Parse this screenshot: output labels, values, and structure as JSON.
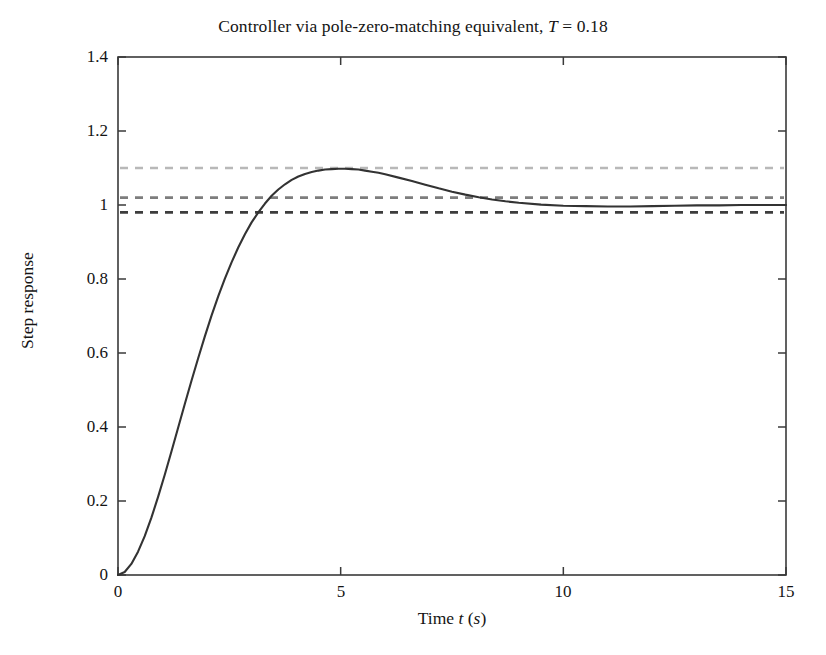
{
  "chart_data": {
    "type": "line",
    "title": "Controller via pole-zero-matching equivalent, T = 0.18",
    "title_parts": {
      "text_before": "Controller via pole-zero-matching equivalent, ",
      "symbol": "T",
      "text_after": " = 0.18"
    },
    "xlabel": "Time t (s)",
    "xlabel_parts": {
      "text_before": "Time ",
      "symbol": "t",
      "unit_open": " (",
      "unit_symbol": "s",
      "unit_close": ")"
    },
    "ylabel": "Step response",
    "xlim": [
      0,
      15
    ],
    "ylim": [
      0,
      1.4
    ],
    "xticks": [
      0,
      5,
      10,
      15
    ],
    "xtick_labels": [
      "0",
      "5",
      "10",
      "15"
    ],
    "yticks": [
      0,
      0.2,
      0.4,
      0.6,
      0.8,
      1,
      1.2,
      1.4
    ],
    "ytick_labels": [
      "0",
      "0.2",
      "0.4",
      "0.6",
      "0.8",
      "1",
      "1.2",
      "1.4"
    ],
    "grid": false,
    "legend": "none",
    "line_color": "#333333",
    "series": [
      {
        "name": "Step response",
        "style": "solid",
        "color": "#333333",
        "x": [
          0,
          0.15,
          0.3,
          0.45,
          0.6,
          0.75,
          0.9,
          1.05,
          1.2,
          1.35,
          1.5,
          1.65,
          1.8,
          1.95,
          2.1,
          2.25,
          2.4,
          2.55,
          2.7,
          2.85,
          3,
          3.15,
          3.3,
          3.45,
          3.6,
          3.75,
          3.9,
          4.05,
          4.2,
          4.35,
          4.5,
          4.65,
          4.8,
          4.95,
          5.1,
          5.25,
          5.4,
          5.55,
          5.7,
          5.85,
          6,
          6.3,
          6.6,
          6.9,
          7.2,
          7.5,
          7.8,
          8.1,
          8.4,
          8.7,
          9,
          9.5,
          10,
          10.5,
          11,
          11.5,
          12,
          12.5,
          13,
          13.5,
          14,
          14.5,
          15
        ],
        "y": [
          0,
          0.008,
          0.03,
          0.063,
          0.105,
          0.155,
          0.211,
          0.271,
          0.334,
          0.398,
          0.462,
          0.525,
          0.586,
          0.645,
          0.701,
          0.753,
          0.801,
          0.845,
          0.885,
          0.921,
          0.953,
          0.98,
          1.004,
          1.025,
          1.042,
          1.056,
          1.068,
          1.077,
          1.084,
          1.089,
          1.093,
          1.096,
          1.097,
          1.098,
          1.098,
          1.097,
          1.096,
          1.093,
          1.09,
          1.087,
          1.083,
          1.074,
          1.065,
          1.055,
          1.045,
          1.036,
          1.028,
          1.021,
          1.015,
          1.01,
          1.006,
          1.001,
          0.998,
          0.997,
          0.996,
          0.996,
          0.997,
          0.998,
          0.999,
          0.999,
          1.0,
          1.0,
          1.0
        ]
      }
    ],
    "reference_lines": [
      {
        "name": "overshoot-line",
        "y": 1.1,
        "style": "dashed",
        "color": "#b8b8b8",
        "label": "1.10 overshoot bound"
      },
      {
        "name": "settling-upper",
        "y": 1.02,
        "style": "dashed",
        "color": "#7d7d7d",
        "label": "+2% settling band"
      },
      {
        "name": "settling-lower",
        "y": 0.98,
        "style": "dashed",
        "color": "#3d3d3d",
        "label": "-2% settling band"
      }
    ],
    "annotations": {
      "peak_value": 1.098,
      "peak_time": 4.85,
      "steady_state": 1.0,
      "overshoot_percent": 10,
      "sampling_period": 0.18
    }
  }
}
